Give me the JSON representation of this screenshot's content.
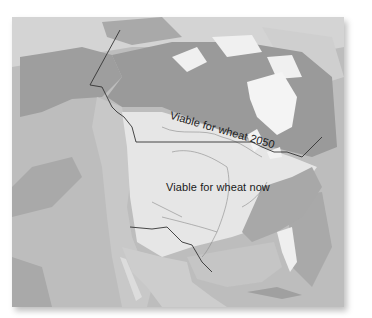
{
  "map": {
    "title": "",
    "region": "North America",
    "labels": {
      "future_zone": "Viable for wheat 2050",
      "current_zone": "Viable for wheat now"
    },
    "colors": {
      "ocean": "#bdbdbd",
      "deep_ocean": "#a9a9a9",
      "shallow_water": "#d4d4d4",
      "ice": "#f4f4f4",
      "land_north": "#9e9e9e",
      "land_mid": "#b4b4b4",
      "wheat_now_zone": "#e6e6e6",
      "mountains": "#c8c8c8",
      "borders": "#333333",
      "rivers": "#8a8a8a",
      "label_text": "#1a1a1a"
    }
  }
}
